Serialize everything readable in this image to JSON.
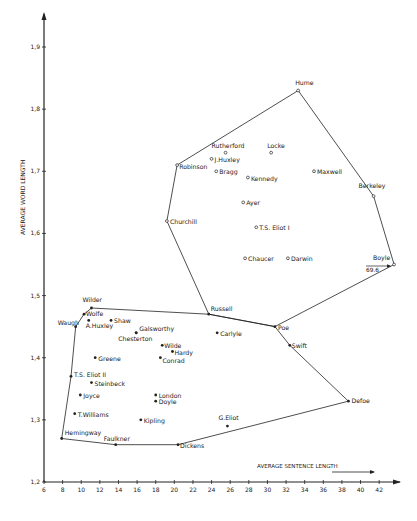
{
  "chart_data": {
    "type": "scatter",
    "title": "",
    "xlabel": "AVERAGE SENTENCE LENGTH",
    "ylabel": "AVERAGE WORD LENGTH",
    "xlim": [
      6,
      44
    ],
    "ylim": [
      1.2,
      1.95
    ],
    "x_ticks": [
      6,
      8,
      10,
      12,
      14,
      16,
      18,
      20,
      22,
      24,
      26,
      28,
      30,
      32,
      34,
      36,
      38,
      40,
      42
    ],
    "y_ticks": [
      "1,2",
      "1,3",
      "1,4",
      "1,5",
      "1,6",
      "1,7",
      "1,8",
      "1,9"
    ],
    "grid": false,
    "annotations": [
      {
        "text": "69.6",
        "at": "Boyle",
        "note": "off-scale value arrow"
      }
    ],
    "groups": [
      {
        "name": "upper",
        "marker": "open-circle",
        "hull": [
          "Hume",
          "Berkeley",
          "Boyle",
          "Poe",
          "Russell",
          "Churchill",
          "Robinson",
          "Hume"
        ],
        "points": [
          {
            "name": "Hume",
            "x": 33.3,
            "y": 1.83
          },
          {
            "name": "Rutherford",
            "x": 25.5,
            "y": 1.73
          },
          {
            "name": "Locke",
            "x": 30.4,
            "y": 1.73
          },
          {
            "name": "J.Huxley",
            "x": 24.0,
            "y": 1.72
          },
          {
            "name": "Robinson",
            "x": 20.3,
            "y": 1.71
          },
          {
            "name": "Bragg",
            "x": 24.5,
            "y": 1.7
          },
          {
            "name": "Kennedy",
            "x": 27.9,
            "y": 1.69
          },
          {
            "name": "Maxwell",
            "x": 35.0,
            "y": 1.7
          },
          {
            "name": "Berkeley",
            "x": 41.4,
            "y": 1.66
          },
          {
            "name": "Ayer",
            "x": 27.4,
            "y": 1.65
          },
          {
            "name": "Churchill",
            "x": 19.2,
            "y": 1.62
          },
          {
            "name": "T.S. Eliot I",
            "x": 28.8,
            "y": 1.61
          },
          {
            "name": "Chaucer",
            "x": 27.6,
            "y": 1.56
          },
          {
            "name": "Darwin",
            "x": 32.2,
            "y": 1.56
          },
          {
            "name": "Boyle",
            "x": 43.6,
            "y": 1.55
          }
        ]
      },
      {
        "name": "lower",
        "marker": "filled-dot",
        "hull": [
          "Wilder",
          "Russell",
          "Poe",
          "Swift",
          "Defoe",
          "Dickens",
          "Faulkner",
          "Hemingway",
          "T.S. Eliot II",
          "Waugh",
          "Wolfe",
          "Wilder"
        ],
        "points": [
          {
            "name": "Wilder",
            "x": 11.1,
            "y": 1.48
          },
          {
            "name": "Wolfe",
            "x": 10.3,
            "y": 1.47
          },
          {
            "name": "A.Huxley",
            "x": 10.8,
            "y": 1.46
          },
          {
            "name": "Shaw",
            "x": 13.2,
            "y": 1.46
          },
          {
            "name": "Waugh",
            "x": 9.4,
            "y": 1.45
          },
          {
            "name": "Galsworthy",
            "x": 15.9,
            "y": 1.44
          },
          {
            "name": "Chesterton",
            "x": 15.9,
            "y": 1.44
          },
          {
            "name": "Russell",
            "x": 23.7,
            "y": 1.47
          },
          {
            "name": "Carlyle",
            "x": 24.6,
            "y": 1.44
          },
          {
            "name": "Poe",
            "x": 30.8,
            "y": 1.45
          },
          {
            "name": "Wilde",
            "x": 18.7,
            "y": 1.42
          },
          {
            "name": "Hardy",
            "x": 19.8,
            "y": 1.41
          },
          {
            "name": "Swift",
            "x": 32.4,
            "y": 1.42
          },
          {
            "name": "Conrad",
            "x": 18.5,
            "y": 1.4
          },
          {
            "name": "Greene",
            "x": 11.5,
            "y": 1.4
          },
          {
            "name": "T.S. Eliot II",
            "x": 8.9,
            "y": 1.37
          },
          {
            "name": "Steinbeck",
            "x": 11.1,
            "y": 1.36
          },
          {
            "name": "Joyce",
            "x": 9.9,
            "y": 1.34
          },
          {
            "name": "London",
            "x": 18.0,
            "y": 1.34
          },
          {
            "name": "Doyle",
            "x": 18.0,
            "y": 1.33
          },
          {
            "name": "Defoe",
            "x": 38.7,
            "y": 1.33
          },
          {
            "name": "T.Williams",
            "x": 9.3,
            "y": 1.31
          },
          {
            "name": "Kipling",
            "x": 16.4,
            "y": 1.3
          },
          {
            "name": "G.Eliot",
            "x": 25.7,
            "y": 1.29
          },
          {
            "name": "Hemingway",
            "x": 7.9,
            "y": 1.27
          },
          {
            "name": "Faulkner",
            "x": 13.7,
            "y": 1.26
          },
          {
            "name": "Dickens",
            "x": 20.4,
            "y": 1.26
          }
        ]
      }
    ]
  },
  "labels": {
    "Hume": {
      "dx": -3,
      "dy": -6,
      "anchor": "start"
    },
    "Rutherford": {
      "dx": -14,
      "dy": -5,
      "anchor": "start"
    },
    "Locke": {
      "dx": -4,
      "dy": -5,
      "anchor": "start"
    },
    "J.Huxley": {
      "dx": 3,
      "dy": 3,
      "anchor": "start"
    },
    "Robinson": {
      "dx": 2,
      "dy": 4,
      "anchor": "start"
    },
    "Bragg": {
      "dx": 3,
      "dy": 3,
      "anchor": "start"
    },
    "Kennedy": {
      "dx": 3,
      "dy": 3,
      "anchor": "start"
    },
    "Maxwell": {
      "dx": 3,
      "dy": 3,
      "anchor": "start"
    },
    "Berkeley": {
      "dx": -15,
      "dy": -8,
      "anchor": "start"
    },
    "Ayer": {
      "dx": 3,
      "dy": 3,
      "anchor": "start"
    },
    "Churchill": {
      "dx": 3,
      "dy": 3,
      "anchor": "start"
    },
    "T.S. Eliot I": {
      "dx": 3,
      "dy": 3,
      "anchor": "start"
    },
    "Chaucer": {
      "dx": 3,
      "dy": 3,
      "anchor": "start"
    },
    "Darwin": {
      "dx": 3,
      "dy": 3,
      "anchor": "start"
    },
    "Boyle": {
      "dx": -21,
      "dy": -5,
      "anchor": "start"
    },
    "Wilder": {
      "dx": -9,
      "dy": -6,
      "anchor": "start"
    },
    "Wolfe": {
      "dx": 2,
      "dy": 2,
      "anchor": "start"
    },
    "A.Huxley": {
      "dx": -3,
      "dy": 8,
      "anchor": "start"
    },
    "Shaw": {
      "dx": 3,
      "dy": 3,
      "anchor": "start"
    },
    "Waugh": {
      "dx": -18,
      "dy": -2,
      "anchor": "start"
    },
    "Galsworthy": {
      "dx": 3,
      "dy": -2,
      "anchor": "start"
    },
    "Chesterton": {
      "dx": -18,
      "dy": 8,
      "anchor": "start"
    },
    "Russell": {
      "dx": 2,
      "dy": -3,
      "anchor": "start"
    },
    "Carlyle": {
      "dx": 3,
      "dy": 3,
      "anchor": "start"
    },
    "Poe": {
      "dx": 3,
      "dy": 3,
      "anchor": "start"
    },
    "Wilde": {
      "dx": 2,
      "dy": 3,
      "anchor": "start"
    },
    "Hardy": {
      "dx": 2,
      "dy": 3,
      "anchor": "start"
    },
    "Swift": {
      "dx": 2,
      "dy": 3,
      "anchor": "start"
    },
    "Conrad": {
      "dx": 2,
      "dy": 5,
      "anchor": "start"
    },
    "Greene": {
      "dx": 3,
      "dy": 3,
      "anchor": "start"
    },
    "T.S. Eliot II": {
      "dx": 3,
      "dy": 1,
      "anchor": "start"
    },
    "Steinbeck": {
      "dx": 3,
      "dy": 3,
      "anchor": "start"
    },
    "Joyce": {
      "dx": 3,
      "dy": 3,
      "anchor": "start"
    },
    "London": {
      "dx": 3,
      "dy": 3,
      "anchor": "start"
    },
    "Doyle": {
      "dx": 3,
      "dy": 3,
      "anchor": "start"
    },
    "Defoe": {
      "dx": 3,
      "dy": 2,
      "anchor": "start"
    },
    "T.Williams": {
      "dx": 3,
      "dy": 3,
      "anchor": "start"
    },
    "Kipling": {
      "dx": 3,
      "dy": 3,
      "anchor": "start"
    },
    "G.Eliot": {
      "dx": -9,
      "dy": -6,
      "anchor": "start"
    },
    "Hemingway": {
      "dx": 3,
      "dy": -4,
      "anchor": "start"
    },
    "Faulkner": {
      "dx": -12,
      "dy": -4,
      "anchor": "start"
    },
    "Dickens": {
      "dx": 2,
      "dy": 3,
      "anchor": "start"
    }
  },
  "colors": {
    "ink": "#222222",
    "background": "#ffffff"
  }
}
